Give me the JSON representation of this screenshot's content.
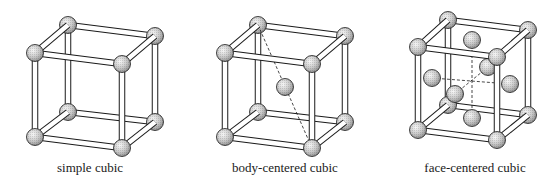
{
  "figure": {
    "panels": [
      {
        "id": "simple-cubic",
        "label": "simple cubic",
        "label_x": 90,
        "offset_x": 0,
        "corners": {
          "btl": [
            68,
            25
          ],
          "btr": [
            155,
            36
          ],
          "ftl": [
            35,
            53
          ],
          "ftr": [
            122,
            64
          ],
          "bbl": [
            68,
            112
          ],
          "bbr": [
            155,
            122
          ],
          "fbl": [
            35,
            137
          ],
          "fbr": [
            122,
            148
          ]
        },
        "extra_atoms": [],
        "dashed_lines": []
      },
      {
        "id": "body-centered-cubic",
        "label": "body-centered cubic",
        "label_x": 285,
        "offset_x": 0,
        "corners": {
          "btl": [
            258,
            25
          ],
          "btr": [
            345,
            36
          ],
          "ftl": [
            225,
            53
          ],
          "ftr": [
            312,
            64
          ],
          "bbl": [
            258,
            112
          ],
          "bbr": [
            345,
            122
          ],
          "fbl": [
            225,
            137
          ],
          "fbr": [
            312,
            148
          ]
        },
        "extra_atoms": [
          [
            285,
            87
          ]
        ],
        "dashed_lines": [
          [
            [
              258,
              25
            ],
            [
              312,
              148
            ]
          ]
        ]
      },
      {
        "id": "face-centered-cubic",
        "label": "face-centered cubic",
        "label_x": 475,
        "offset_x": 0,
        "corners": {
          "btl": [
            448,
            20
          ],
          "btr": [
            528,
            30
          ],
          "ftl": [
            418,
            47
          ],
          "ftr": [
            497,
            57
          ],
          "bbl": [
            448,
            105
          ],
          "bbr": [
            528,
            115
          ],
          "fbl": [
            418,
            130
          ],
          "fbr": [
            497,
            140
          ]
        },
        "extra_atoms": [
          [
            472,
            40
          ],
          [
            432,
            78
          ],
          [
            510,
            84
          ],
          [
            488,
            67
          ],
          [
            455,
            94
          ],
          [
            472,
            118
          ]
        ],
        "dashed_lines": [
          [
            [
              472,
              40
            ],
            [
              472,
              118
            ]
          ],
          [
            [
              432,
              78
            ],
            [
              510,
              84
            ]
          ],
          [
            [
              488,
              67
            ],
            [
              455,
              94
            ]
          ]
        ]
      }
    ],
    "colors": {
      "rod_fill": "#ffffff",
      "rod_stroke": "#1a1a1a",
      "atom_light": "#f2f2f2",
      "atom_mid": "#bdbdbd",
      "atom_dark": "#8a8a8a",
      "text": "#1a1a1a"
    },
    "atom_radius": 8.5,
    "rod_width": 4.5
  }
}
